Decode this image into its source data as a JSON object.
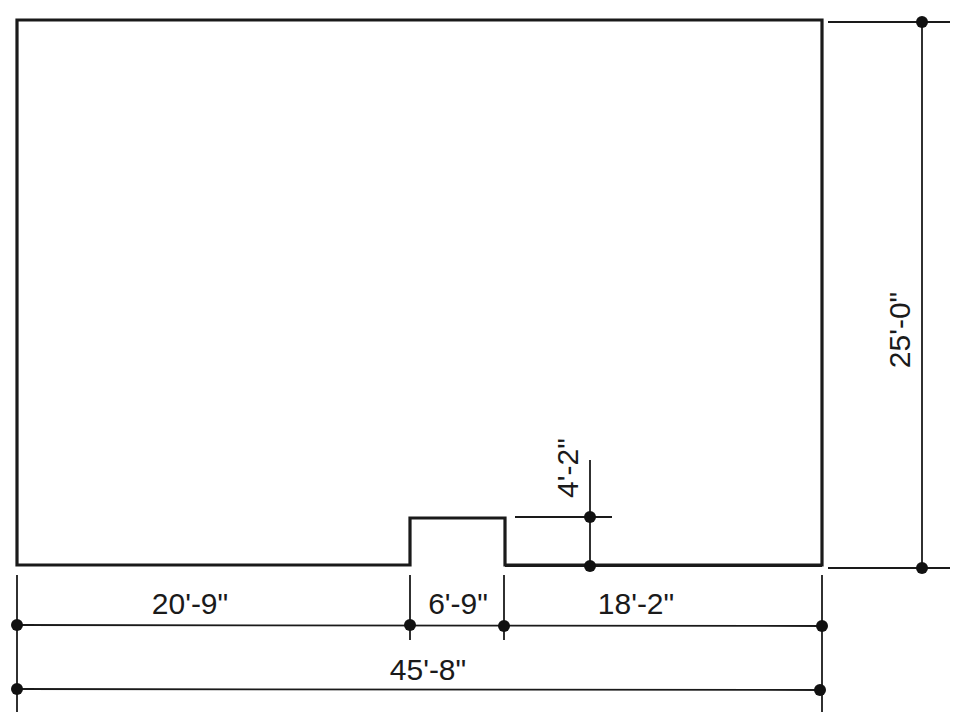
{
  "drawing": {
    "type": "floor-plan-outline",
    "outline": {
      "overall_width": "45'-8\"",
      "overall_depth": "25'-0\"",
      "bump_out": {
        "width": "6'-9\"",
        "depth": "4'-2\""
      }
    },
    "dimensions": {
      "left_segment": "20'-9\"",
      "bump_segment": "6'-9\"",
      "right_segment": "18'-2\"",
      "overall_width": "45'-8\"",
      "overall_depth": "25'-0\"",
      "bump_depth": "4'-2\""
    },
    "colors": {
      "line": "#1a1a1a",
      "background": "#ffffff"
    }
  }
}
